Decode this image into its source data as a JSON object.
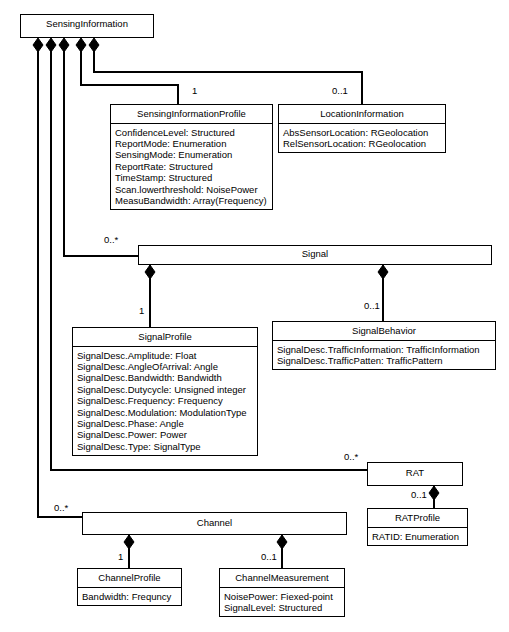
{
  "diagram": {
    "stroke_color": "#000000",
    "fill_color": "#ffffff"
  },
  "classes": {
    "sensing_information": {
      "name": "SensingInformation",
      "attributes": []
    },
    "sensing_information_profile": {
      "name": "SensingInformationProfile",
      "attributes": [
        "ConfidenceLevel: Structured",
        "ReportMode: Enumeration",
        "SensingMode: Enumeration",
        "ReportRate: Structured",
        "TimeStamp: Structured",
        "Scan.lowerthreshold: NoisePower",
        "MeasuBandwidth: Array(Frequency)"
      ]
    },
    "location_information": {
      "name": "LocationInformation",
      "attributes": [
        "AbsSensorLocation: RGeolocation",
        "RelSensorLocation: RGeolocation"
      ]
    },
    "signal": {
      "name": "Signal",
      "attributes": []
    },
    "signal_profile": {
      "name": "SignalProfile",
      "attributes": [
        "SignalDesc.Amplitude: Float",
        "SignalDesc.AngleOfArrival: Angle",
        "SignalDesc.Bandwidth: Bandwidth",
        "SignalDesc.Dutycycle: Unsigned integer",
        "SignalDesc.Frequency: Frequency",
        "SignalDesc.Modulation: ModulationType",
        "SignalDesc.Phase: Angle",
        "SignalDesc.Power: Power",
        "SignalDesc.Type: SignalType"
      ]
    },
    "signal_behavior": {
      "name": "SignalBehavior",
      "attributes": [
        "SignalDesc.TrafficInformation: TrafficInformation",
        "SignalDesc.TrafficPatten: TrafficPattern"
      ]
    },
    "rat": {
      "name": "RAT",
      "attributes": []
    },
    "rat_profile": {
      "name": "RATProfile",
      "attributes": [
        "RATID: Enumeration"
      ]
    },
    "channel": {
      "name": "Channel",
      "attributes": []
    },
    "channel_profile": {
      "name": "ChannelProfile",
      "attributes": [
        "Bandwidth: Frequncy"
      ]
    },
    "channel_measurement": {
      "name": "ChannelMeasurement",
      "attributes": [
        "NoisePower: Fiexed-point",
        "SignalLevel: Structured"
      ]
    }
  },
  "multiplicities": {
    "sensing_profile": "1",
    "location_information": "0..1",
    "signal": "0..*",
    "signal_profile": "1",
    "signal_behavior": "0..1",
    "rat": "0..*",
    "rat_profile": "0..1",
    "channel": "0..*",
    "channel_profile": "1",
    "channel_measurement": "0..1"
  }
}
